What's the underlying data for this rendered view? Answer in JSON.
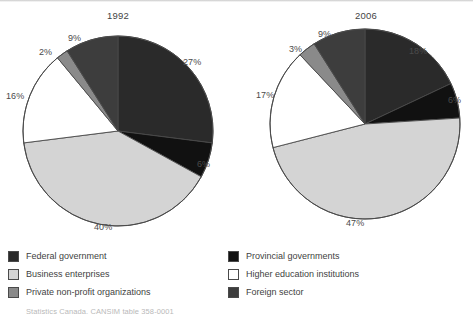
{
  "figure": {
    "source_note": "Statistics Canada, CANSIM table 358-0001"
  },
  "charts": [
    {
      "id": "pie-1992",
      "title": "1992",
      "labels": [
        "27%",
        "6%",
        "40%",
        "16%",
        "2%",
        "9%"
      ]
    },
    {
      "id": "pie-2006",
      "title": "2006",
      "labels": [
        "18%",
        "6%",
        "47%",
        "17%",
        "3%",
        "9%"
      ]
    }
  ],
  "legend": {
    "left": [
      {
        "label": "Federal government",
        "color": "#2a2a2a"
      },
      {
        "label": "Business enterprises",
        "color": "#d4d4d4"
      },
      {
        "label": "Private non-profit organizations",
        "color": "#8a8a8a"
      }
    ],
    "right": [
      {
        "label": "Provincial governments",
        "color": "#111111"
      },
      {
        "label": "Higher education institutions",
        "color": "#ffffff"
      },
      {
        "label": "Foreign sector",
        "color": "#3d3d3d"
      }
    ]
  },
  "chart_data": [
    {
      "type": "pie",
      "title": "1992",
      "categories": [
        "Federal government",
        "Provincial governments",
        "Business enterprises",
        "Higher education institutions",
        "Private non-profit organizations",
        "Foreign sector"
      ],
      "values": [
        27,
        6,
        40,
        16,
        2,
        9
      ],
      "value_labels": [
        "27%",
        "6%",
        "40%",
        "16%",
        "2%",
        "9%"
      ],
      "colors": [
        "#2a2a2a",
        "#111111",
        "#d4d4d4",
        "#ffffff",
        "#8a8a8a",
        "#3d3d3d"
      ],
      "units": "percent",
      "start_angle_deg": 0,
      "direction": "clockwise",
      "legend_position": "bottom",
      "grid": false
    },
    {
      "type": "pie",
      "title": "2006",
      "categories": [
        "Federal government",
        "Provincial governments",
        "Business enterprises",
        "Higher education institutions",
        "Private non-profit organizations",
        "Foreign sector"
      ],
      "values": [
        18,
        6,
        47,
        17,
        3,
        9
      ],
      "value_labels": [
        "18%",
        "6%",
        "47%",
        "17%",
        "3%",
        "9%"
      ],
      "colors": [
        "#2a2a2a",
        "#111111",
        "#d4d4d4",
        "#ffffff",
        "#8a8a8a",
        "#3d3d3d"
      ],
      "units": "percent",
      "start_angle_deg": 0,
      "direction": "clockwise",
      "legend_position": "bottom",
      "grid": false
    }
  ]
}
